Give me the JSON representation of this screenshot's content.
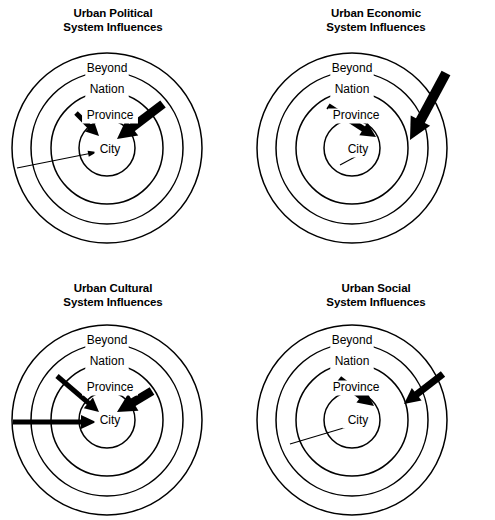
{
  "figure": {
    "kind": "concentric-ring-diagram-set",
    "background_color": "#ffffff",
    "stroke_color": "#000000",
    "panel_count": 4
  },
  "panels": [
    {
      "id": "urban-political",
      "title_line1": "Urban Political",
      "title_line2": "System Influences",
      "center_x": 107,
      "center_y": 148,
      "title_x": 113,
      "title_y1": 17,
      "title_y2": 31,
      "rings": [
        {
          "name": "Beyond",
          "radius": 95,
          "label_x": 107,
          "label_y": 72
        },
        {
          "name": "Nation",
          "radius": 76,
          "label_x": 107,
          "label_y": 93
        },
        {
          "name": "Province",
          "radius": 56,
          "label_x": 110,
          "label_y": 119
        },
        {
          "name": "City",
          "radius": 28,
          "label_x": 110,
          "label_y": 153
        }
      ],
      "arrows": [
        {
          "name": "thin-arrow-from-beyond",
          "weight": "thin",
          "x1": 17,
          "y1": 168,
          "x2": 97,
          "y2": 152,
          "line_width": 1.1,
          "head_length": 9,
          "head_width": 6
        },
        {
          "name": "medium-arrow-from-province",
          "weight": "medium",
          "x1": 76,
          "y1": 113,
          "x2": 99,
          "y2": 136,
          "line_width": 5,
          "head_length": 13,
          "head_width": 13
        },
        {
          "name": "thick-arrow-from-nation",
          "weight": "thick",
          "x1": 163,
          "y1": 104,
          "x2": 117,
          "y2": 139,
          "line_width": 9,
          "head_length": 19,
          "head_width": 20
        }
      ]
    },
    {
      "id": "urban-economic",
      "title_line1": "Urban Economic",
      "title_line2": "System Influences",
      "center_x": 352,
      "center_y": 148,
      "title_x": 376,
      "title_y1": 17,
      "title_y2": 31,
      "rings": [
        {
          "name": "Beyond",
          "radius": 95,
          "label_x": 352,
          "label_y": 72
        },
        {
          "name": "Nation",
          "radius": 76,
          "label_x": 352,
          "label_y": 93
        },
        {
          "name": "Province",
          "radius": 56,
          "label_x": 356,
          "label_y": 119
        },
        {
          "name": "City",
          "radius": 28,
          "label_x": 358,
          "label_y": 153
        }
      ],
      "arrows": [
        {
          "name": "thin-arrow-from-province",
          "weight": "thin",
          "x1": 340,
          "y1": 165,
          "x2": 368,
          "y2": 150,
          "line_width": 1.1,
          "head_length": 9,
          "head_width": 6
        },
        {
          "name": "medium-arrow-from-nation",
          "weight": "medium",
          "x1": 328,
          "y1": 106,
          "x2": 376,
          "y2": 137,
          "line_width": 6,
          "head_length": 15,
          "head_width": 15
        },
        {
          "name": "thick-arrow-from-beyond",
          "weight": "thick",
          "x1": 446,
          "y1": 73,
          "x2": 410,
          "y2": 140,
          "line_width": 10,
          "head_length": 22,
          "head_width": 22
        }
      ]
    },
    {
      "id": "urban-cultural",
      "title_line1": "Urban Cultural",
      "title_line2": "System Influences",
      "center_x": 107,
      "center_y": 420,
      "title_x": 113,
      "title_y1": 292,
      "title_y2": 306,
      "rings": [
        {
          "name": "Beyond",
          "radius": 95,
          "label_x": 107,
          "label_y": 344
        },
        {
          "name": "Nation",
          "radius": 76,
          "label_x": 107,
          "label_y": 365
        },
        {
          "name": "Province",
          "radius": 56,
          "label_x": 110,
          "label_y": 391
        },
        {
          "name": "City",
          "radius": 28,
          "label_x": 110,
          "label_y": 424
        }
      ],
      "arrows": [
        {
          "name": "thick-arrow-from-beyond",
          "weight": "thick",
          "x1": 13,
          "y1": 422,
          "x2": 96,
          "y2": 422,
          "line_width": 5,
          "head_length": 15,
          "head_width": 14
        },
        {
          "name": "medium-arrow-from-nation",
          "weight": "medium",
          "x1": 57,
          "y1": 376,
          "x2": 99,
          "y2": 412,
          "line_width": 5,
          "head_length": 14,
          "head_width": 14
        },
        {
          "name": "thick-arrow-from-province",
          "weight": "thick",
          "x1": 152,
          "y1": 391,
          "x2": 117,
          "y2": 412,
          "line_width": 9,
          "head_length": 19,
          "head_width": 20
        }
      ]
    },
    {
      "id": "urban-social",
      "title_line1": "Urban Social",
      "title_line2": "System Influences",
      "center_x": 352,
      "center_y": 420,
      "title_x": 376,
      "title_y1": 292,
      "title_y2": 306,
      "rings": [
        {
          "name": "Beyond",
          "radius": 95,
          "label_x": 352,
          "label_y": 344
        },
        {
          "name": "Nation",
          "radius": 76,
          "label_x": 352,
          "label_y": 365
        },
        {
          "name": "Province",
          "radius": 56,
          "label_x": 356,
          "label_y": 391
        },
        {
          "name": "City",
          "radius": 28,
          "label_x": 358,
          "label_y": 424
        }
      ],
      "arrows": [
        {
          "name": "thin-arrow-from-beyond",
          "weight": "thin",
          "x1": 290,
          "y1": 444,
          "x2": 370,
          "y2": 420,
          "line_width": 1.1,
          "head_length": 9,
          "head_width": 6
        },
        {
          "name": "thick-arrow-from-province-left",
          "weight": "thick",
          "x1": 339,
          "y1": 379,
          "x2": 374,
          "y2": 406,
          "line_width": 7,
          "head_length": 16,
          "head_width": 16
        },
        {
          "name": "thick-arrow-from-province-right",
          "weight": "thick",
          "x1": 443,
          "y1": 374,
          "x2": 404,
          "y2": 404,
          "line_width": 7,
          "head_length": 16,
          "head_width": 16
        }
      ]
    }
  ]
}
